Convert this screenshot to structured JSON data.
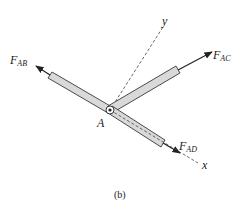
{
  "figure": {
    "caption": "(b)",
    "joint": {
      "label": "A",
      "cx": 110,
      "cy": 110
    },
    "axes": {
      "x": {
        "label": "x",
        "end": [
          198,
          163
        ],
        "label_pos": [
          202,
          168
        ]
      },
      "y": {
        "label": "y",
        "end": [
          163,
          27
        ],
        "label_pos": [
          162,
          24
        ]
      }
    },
    "members": [
      {
        "id": "AB",
        "force_main": "F",
        "force_sub": "AB",
        "label_pos": [
          10,
          62
        ]
      },
      {
        "id": "AC",
        "force_main": "F",
        "force_sub": "AC",
        "label_pos": [
          213,
          57
        ]
      },
      {
        "id": "AD",
        "force_main": "F",
        "force_sub": "AD",
        "label_pos": [
          178,
          148
        ]
      }
    ],
    "colors": {
      "member_fill": "#d9d9d9",
      "stroke": "#222222",
      "dash": "#444444"
    }
  }
}
